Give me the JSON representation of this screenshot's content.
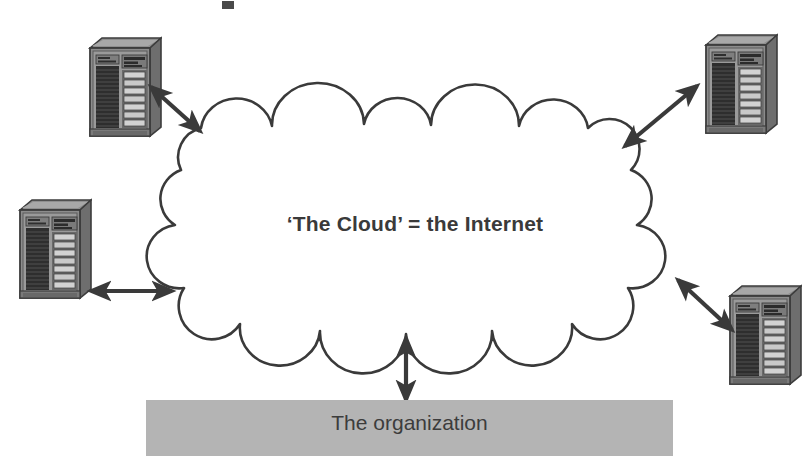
{
  "figure": {
    "background_color": "#ffffff",
    "line_color": "#3a3a3a",
    "cloud": {
      "label": "‘The Cloud’ = the Internet",
      "icon_name": "cloud-shape",
      "fill": "#ffffff",
      "stroke": "#3a3a3a"
    },
    "organization": {
      "label": "The organization",
      "icon_name": "organization-bar",
      "fill": "#b4b4b4",
      "text_color": "#3c3c3c"
    },
    "nodes": [
      {
        "id": "server-top-left",
        "label": "",
        "icon_name": "server-rack-icon",
        "position": "top-left"
      },
      {
        "id": "server-top-right",
        "label": "",
        "icon_name": "server-rack-icon",
        "position": "top-right"
      },
      {
        "id": "server-middle-left",
        "label": "",
        "icon_name": "server-rack-icon",
        "position": "middle-left"
      },
      {
        "id": "server-bottom-right",
        "label": "",
        "icon_name": "server-rack-icon",
        "position": "bottom-right"
      }
    ],
    "connectors": [
      {
        "id": "connector-top-left",
        "from": "server-top-left",
        "to": "cloud",
        "style": "double-headed-arrow",
        "orientation": "diagonal"
      },
      {
        "id": "connector-top-right",
        "from": "cloud",
        "to": "server-top-right",
        "style": "double-headed-arrow",
        "orientation": "diagonal"
      },
      {
        "id": "connector-middle-left",
        "from": "server-middle-left",
        "to": "cloud",
        "style": "double-headed-arrow",
        "orientation": "horizontal"
      },
      {
        "id": "connector-bottom-right",
        "from": "cloud",
        "to": "server-bottom-right",
        "style": "double-headed-arrow",
        "orientation": "diagonal"
      },
      {
        "id": "connector-organization",
        "from": "cloud",
        "to": "organization",
        "style": "double-headed-arrow",
        "orientation": "vertical"
      }
    ],
    "artifact": {
      "name": "scan-artifact",
      "visible": true
    }
  }
}
